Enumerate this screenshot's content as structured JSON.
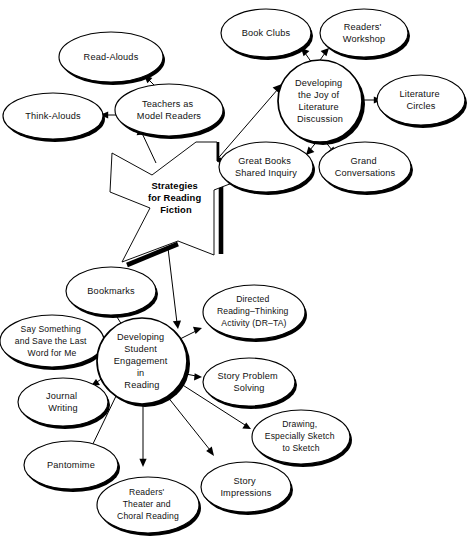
{
  "diagram": {
    "title": "Strategies for Reading Fiction",
    "type": "concept-map",
    "center": {
      "id": "star-center",
      "label_lines": [
        "Strategies",
        "for Reading",
        "Fiction"
      ],
      "shape": "seven-pointed-star",
      "style": "white fill, black outline with offset black drop shadow"
    },
    "colors": {
      "background": "#ffffff",
      "stroke": "#000000",
      "text": "#111111",
      "shadow": "#000000"
    },
    "hubs": [
      {
        "id": "hub-teachers",
        "label_lines": [
          "Teachers as",
          "Model Readers"
        ],
        "shape": "ellipse",
        "children": [
          "Read-Alouds",
          "Think-Alouds"
        ]
      },
      {
        "id": "hub-joy",
        "label_lines": [
          "Developing",
          "the Joy of",
          "Literature",
          "Discussion"
        ],
        "shape": "circle",
        "children": [
          "Book Clubs",
          "Readers' Workshop",
          "Literature Circles",
          "Grand Conversations",
          "Great Books Shared Inquiry"
        ]
      },
      {
        "id": "hub-engagement",
        "label_lines": [
          "Developing",
          "Student",
          "Engagement",
          "in",
          "Reading"
        ],
        "shape": "circle",
        "children": [
          "Bookmarks",
          "Say Something and Save the Last Word for Me",
          "Journal Writing",
          "Pantomime",
          "Readers' Theater and Choral Reading",
          "Story Impressions",
          "Drawing, Especially Sketch to Sketch",
          "Story Problem Solving",
          "Directed Reading-Thinking Activity (DR-TA)"
        ]
      }
    ],
    "nodes": [
      {
        "id": "read-alouds",
        "label_lines": [
          "Read-Alouds"
        ]
      },
      {
        "id": "think-alouds",
        "label_lines": [
          "Think-Alouds"
        ]
      },
      {
        "id": "teachers-as-model-readers",
        "label_lines": [
          "Teachers as",
          "Model Readers"
        ]
      },
      {
        "id": "book-clubs",
        "label_lines": [
          "Book Clubs"
        ]
      },
      {
        "id": "readers-workshop",
        "label_lines": [
          "Readers'",
          "Workshop"
        ]
      },
      {
        "id": "developing-joy",
        "label_lines": [
          "Developing",
          "the Joy of",
          "Literature",
          "Discussion"
        ]
      },
      {
        "id": "literature-circles",
        "label_lines": [
          "Literature",
          "Circles"
        ]
      },
      {
        "id": "great-books",
        "label_lines": [
          "Great Books",
          "Shared Inquiry"
        ]
      },
      {
        "id": "grand-conversations",
        "label_lines": [
          "Grand",
          "Conversations"
        ]
      },
      {
        "id": "bookmarks",
        "label_lines": [
          "Bookmarks"
        ]
      },
      {
        "id": "directed-reading",
        "label_lines": [
          "Directed",
          "Reading–Thinking",
          "Activity (DR–TA)"
        ]
      },
      {
        "id": "say-something",
        "label_lines": [
          "Say Something",
          "and Save the Last",
          "Word for Me"
        ]
      },
      {
        "id": "developing-engagement",
        "label_lines": [
          "Developing",
          "Student",
          "Engagement",
          "in",
          "Reading"
        ]
      },
      {
        "id": "story-problem-solving",
        "label_lines": [
          "Story Problem",
          "Solving"
        ]
      },
      {
        "id": "journal-writing",
        "label_lines": [
          "Journal",
          "Writing"
        ]
      },
      {
        "id": "drawing-sketch",
        "label_lines": [
          "Drawing,",
          "Especially Sketch",
          "to Sketch"
        ]
      },
      {
        "id": "pantomime",
        "label_lines": [
          "Pantomime"
        ]
      },
      {
        "id": "story-impressions",
        "label_lines": [
          "Story",
          "Impressions"
        ]
      },
      {
        "id": "readers-theater",
        "label_lines": [
          "Readers'",
          "Theater and",
          "Choral Reading"
        ]
      }
    ],
    "edges": [
      {
        "from": "star-center",
        "to": "teachers-as-model-readers",
        "arrow": "to"
      },
      {
        "from": "star-center",
        "to": "developing-joy",
        "arrow": "to"
      },
      {
        "from": "star-center",
        "to": "developing-engagement",
        "arrow": "to"
      },
      {
        "from": "teachers-as-model-readers",
        "to": "read-alouds",
        "arrow": "to"
      },
      {
        "from": "teachers-as-model-readers",
        "to": "think-alouds",
        "arrow": "to"
      },
      {
        "from": "developing-joy",
        "to": "book-clubs",
        "arrow": "to"
      },
      {
        "from": "developing-joy",
        "to": "readers-workshop",
        "arrow": "to"
      },
      {
        "from": "developing-joy",
        "to": "literature-circles",
        "arrow": "to"
      },
      {
        "from": "developing-joy",
        "to": "great-books",
        "arrow": "to"
      },
      {
        "from": "developing-joy",
        "to": "grand-conversations",
        "arrow": "to"
      },
      {
        "from": "developing-engagement",
        "to": "bookmarks",
        "arrow": "to"
      },
      {
        "from": "developing-engagement",
        "to": "directed-reading",
        "arrow": "to"
      },
      {
        "from": "developing-engagement",
        "to": "say-something",
        "arrow": "to"
      },
      {
        "from": "developing-engagement",
        "to": "journal-writing",
        "arrow": "to"
      },
      {
        "from": "developing-engagement",
        "to": "pantomime",
        "arrow": "to"
      },
      {
        "from": "developing-engagement",
        "to": "readers-theater",
        "arrow": "to"
      },
      {
        "from": "developing-engagement",
        "to": "story-impressions",
        "arrow": "to"
      },
      {
        "from": "developing-engagement",
        "to": "drawing-sketch",
        "arrow": "to"
      },
      {
        "from": "developing-engagement",
        "to": "story-problem-solving",
        "arrow": "to"
      }
    ]
  }
}
